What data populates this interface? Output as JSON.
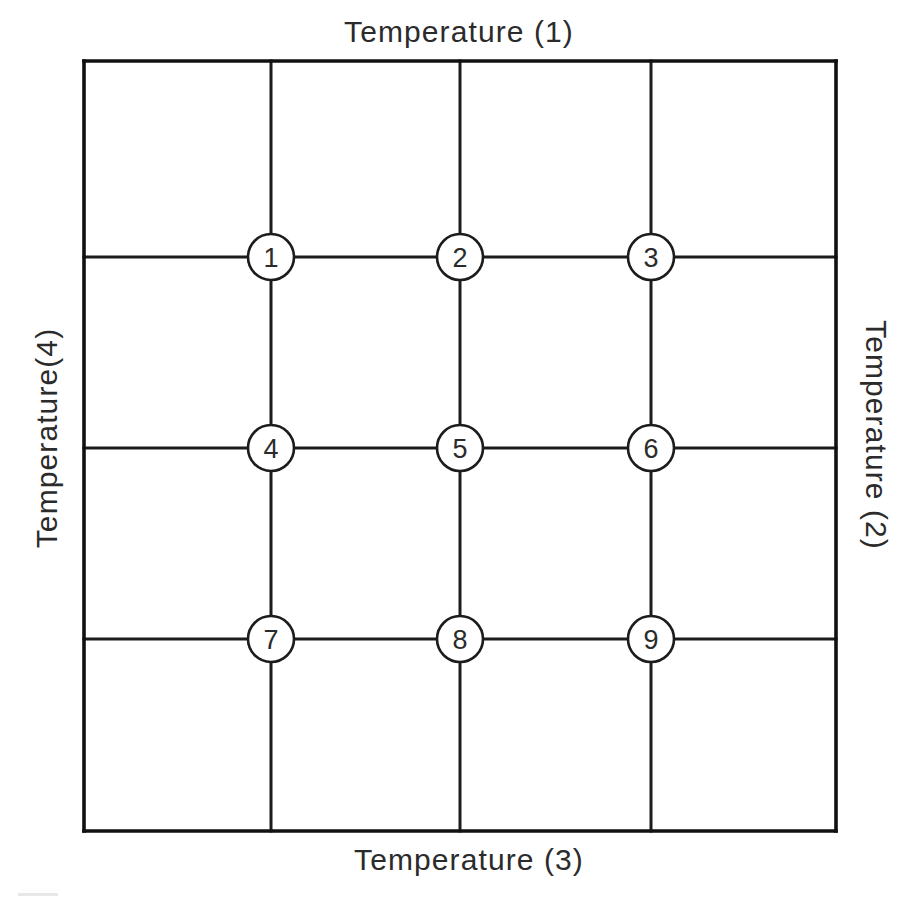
{
  "diagram": {
    "type": "grid-node-diagram",
    "background_color": "#ffffff",
    "line_color": "#1c1c1c",
    "text_color": "#2b2b2b",
    "node_fill_color": "#ffffff"
  },
  "edge_labels": {
    "top": "Temperature (1)",
    "right": "Temperature (2)",
    "bottom": "Temperature (3)",
    "left": "Temperature(4)"
  },
  "frame": {
    "left": 84,
    "top": 61,
    "right": 836,
    "bottom": 831,
    "columns": 4,
    "rows": 4
  },
  "grid_lines": {
    "vertical_x": [
      271,
      460,
      651
    ],
    "horizontal_y": [
      257,
      448,
      639
    ]
  },
  "nodes": [
    {
      "label": "1",
      "x": 271,
      "y": 257,
      "r": 23,
      "row": 1,
      "col": 1
    },
    {
      "label": "2",
      "x": 460,
      "y": 257,
      "r": 23,
      "row": 1,
      "col": 2
    },
    {
      "label": "3",
      "x": 651,
      "y": 257,
      "r": 23,
      "row": 1,
      "col": 3
    },
    {
      "label": "4",
      "x": 271,
      "y": 448,
      "r": 23,
      "row": 2,
      "col": 1
    },
    {
      "label": "5",
      "x": 460,
      "y": 448,
      "r": 23,
      "row": 2,
      "col": 2
    },
    {
      "label": "6",
      "x": 651,
      "y": 448,
      "r": 23,
      "row": 2,
      "col": 3
    },
    {
      "label": "7",
      "x": 271,
      "y": 639,
      "r": 23,
      "row": 3,
      "col": 1
    },
    {
      "label": "8",
      "x": 460,
      "y": 639,
      "r": 23,
      "row": 3,
      "col": 2
    },
    {
      "label": "9",
      "x": 651,
      "y": 639,
      "r": 23,
      "row": 3,
      "col": 3
    }
  ]
}
